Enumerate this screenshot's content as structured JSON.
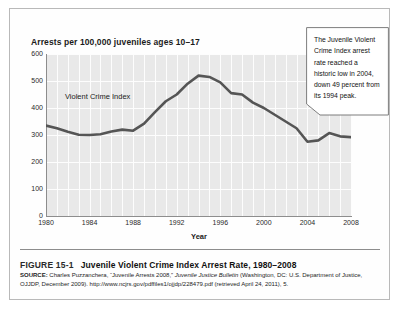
{
  "figure": {
    "number_label": "FIGURE 15-1",
    "title": "Juvenile Violent Crime Index Arrest Rate, 1980–2008",
    "source_label": "SOURCE:",
    "source_part1": " Charles Puzzanchera, “Juvenile Arrests 2008,” ",
    "source_italic": "Juvenile Justice Bulletin",
    "source_part2": " (Washington, DC: U.S. Department of Justice, OJJDP, December 2009). http://www.ncjrs.gov/pdffiles1/ojjdp/228479.pdf (retrieved April 24, 2011), 5."
  },
  "callout": {
    "text": "The Juvenile Violent Crime Index arrest rate reached a historic low in 2004, down 49 percent from its 1994 peak."
  },
  "chart_data": {
    "type": "line",
    "title": "Arrests per 100,000 juveniles ages 10–17",
    "xlabel": "Year",
    "ylabel": "",
    "series_label": "Violent Crime Index",
    "xlim": [
      1980,
      2008
    ],
    "ylim": [
      0,
      600
    ],
    "yticks": [
      600,
      500,
      400,
      300,
      200,
      100,
      0
    ],
    "xticks": [
      1980,
      1984,
      1988,
      1992,
      1996,
      2000,
      2004,
      2008
    ],
    "grid": true,
    "legend": "none",
    "line_color": "#555555",
    "plot_background": "#e9e9e9",
    "gridline_color": "#fdfdfd",
    "x": [
      1980,
      1981,
      1982,
      1983,
      1984,
      1985,
      1986,
      1987,
      1988,
      1989,
      1990,
      1991,
      1992,
      1993,
      1994,
      1995,
      1996,
      1997,
      1998,
      1999,
      2000,
      2001,
      2002,
      2003,
      2004,
      2005,
      2006,
      2007,
      2008
    ],
    "values": [
      335,
      325,
      312,
      301,
      300,
      303,
      313,
      320,
      316,
      342,
      385,
      425,
      450,
      490,
      520,
      515,
      495,
      455,
      450,
      420,
      400,
      375,
      350,
      325,
      275,
      280,
      307,
      295,
      292
    ]
  }
}
